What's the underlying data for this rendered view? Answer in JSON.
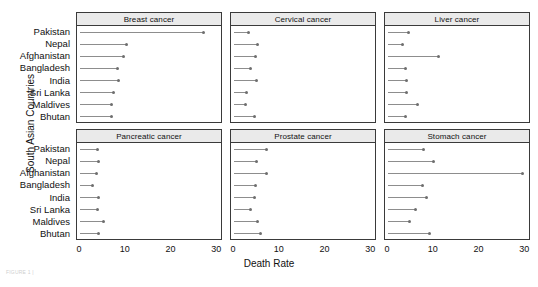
{
  "chart_data": {
    "type": "scatter",
    "subtype": "lollipop-dot-plot-facets",
    "title": "",
    "xlabel": "Death Rate",
    "ylabel": "South Asian Countries",
    "xlim": [
      0,
      30
    ],
    "xticks": [
      0,
      10,
      20,
      30
    ],
    "xtick_labels": [
      "0",
      "10",
      "20",
      "30"
    ],
    "grid": false,
    "legend": "none",
    "categories": [
      "Pakistan",
      "Nepal",
      "Afghanistan",
      "Bangladesh",
      "India",
      "Sri Lanka",
      "Maldives",
      "Bhutan"
    ],
    "facets": [
      {
        "label": "Breast cancer",
        "values": [
          27.3,
          10.4,
          9.6,
          8.3,
          8.6,
          7.5,
          7.1,
          7.0
        ]
      },
      {
        "label": "Cervical cancer",
        "values": [
          3.2,
          5.2,
          4.8,
          3.7,
          5.0,
          2.7,
          2.6,
          4.5
        ]
      },
      {
        "label": "Liver cancer",
        "values": [
          4.5,
          3.3,
          11.3,
          3.9,
          4.1,
          4.1,
          6.5,
          3.9
        ]
      },
      {
        "label": "Pancreatic cancer",
        "values": [
          3.9,
          4.1,
          3.7,
          2.9,
          4.2,
          3.8,
          5.2,
          4.1
        ]
      },
      {
        "label": "Prostate cancer",
        "values": [
          7.3,
          5.1,
          7.3,
          4.8,
          4.5,
          3.7,
          5.2,
          6.0
        ]
      },
      {
        "label": "Stomach cancer",
        "values": [
          7.8,
          10.2,
          29.8,
          7.6,
          8.6,
          6.1,
          4.8,
          9.3
        ]
      }
    ],
    "colors": {
      "dot": "#6e6e6e",
      "stem": "#8d8d8d",
      "panel_border": "#3a3a3a",
      "strip_background": "#eaeaea",
      "text": "#111111",
      "background": "#ffffff"
    }
  },
  "caption": "FIGURE 1 |"
}
